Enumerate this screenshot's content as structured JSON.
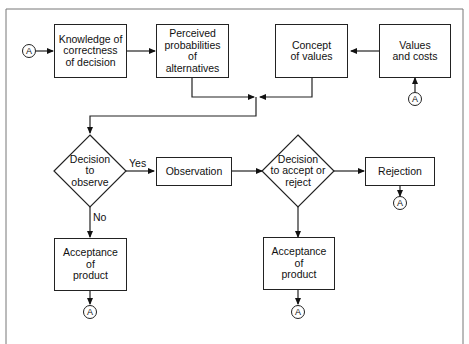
{
  "diagram": {
    "type": "flowchart",
    "nodes": {
      "knowledge": "Knowledge of\ncorrectness\nof decision",
      "perceived": "Perceived\nprobabilities\nof\nalternatives",
      "concept": "Concept\nof values",
      "values_costs": "Values\nand costs",
      "decision_observe": "Decision\nto\nobserve",
      "observation": "Observation",
      "decision_accept": "Decision\nto accept or\nreject",
      "rejection": "Rejection",
      "acceptance_1": "Acceptance\nof\nproduct",
      "acceptance_2": "Acceptance\nof\nproduct"
    },
    "connector_label": "A",
    "edge_labels": {
      "yes": "Yes",
      "no": "No"
    },
    "edges": [
      {
        "from": "A",
        "to": "knowledge"
      },
      {
        "from": "knowledge",
        "to": "perceived"
      },
      {
        "from": "values_costs",
        "to": "concept"
      },
      {
        "from": "A",
        "to": "values_costs"
      },
      {
        "from": "perceived",
        "to": "junction"
      },
      {
        "from": "concept",
        "to": "junction"
      },
      {
        "from": "junction",
        "to": "decision_observe"
      },
      {
        "from": "decision_observe",
        "to": "observation",
        "label": "Yes"
      },
      {
        "from": "decision_observe",
        "to": "acceptance_1",
        "label": "No"
      },
      {
        "from": "observation",
        "to": "decision_accept"
      },
      {
        "from": "decision_accept",
        "to": "rejection"
      },
      {
        "from": "decision_accept",
        "to": "acceptance_2"
      },
      {
        "from": "rejection",
        "to": "A"
      },
      {
        "from": "acceptance_1",
        "to": "A"
      },
      {
        "from": "acceptance_2",
        "to": "A"
      }
    ]
  }
}
